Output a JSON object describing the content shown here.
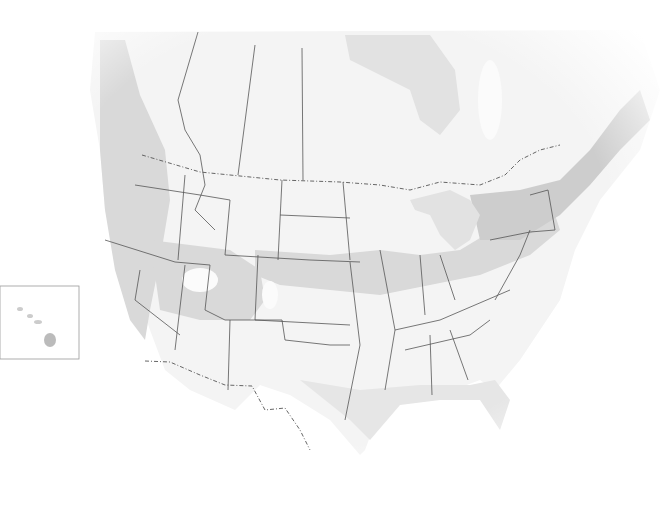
{
  "map": {
    "subject": "North America (United States and southern Canada)",
    "style": "grayscale shaded zone map with state/province borders",
    "labels": [],
    "inset": {
      "name": "hawaii-inset",
      "x": 0,
      "y": 286,
      "width": 79,
      "height": 73
    },
    "colors": {
      "background": "#ffffff",
      "land": "#f4f4f4",
      "zone_light": "#e6e6e6",
      "zone_medium": "#d9d9d9",
      "zone_dark": "#cdcdcd",
      "border": "#555555",
      "inset_frame": "#999999"
    }
  }
}
